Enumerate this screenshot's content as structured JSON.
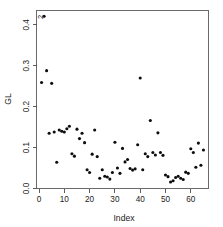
{
  "chart_data": {
    "type": "scatter",
    "title": "",
    "xlabel": "Index",
    "ylabel": "GL",
    "xlim": [
      -1,
      67
    ],
    "ylim": [
      0.0,
      0.435
    ],
    "grid": false,
    "legend": null,
    "xticks": [
      0,
      10,
      20,
      30,
      40,
      50,
      60
    ],
    "xtick_labels": [
      "0",
      "10",
      "20",
      "30",
      "40",
      "50",
      "60"
    ],
    "yticks": [
      0.0,
      0.1,
      0.2,
      0.3,
      0.4
    ],
    "ytick_labels": [
      "0.0",
      "0.1",
      "0.2",
      "0.3",
      "0.4"
    ],
    "marker": "filled-circle",
    "marker_color": "#0d0d0d",
    "annotations": [
      {
        "text": "2",
        "x": 2,
        "y": 0.405,
        "dx": -1,
        "dy": -6
      }
    ],
    "x": [
      1,
      2,
      3,
      4,
      5,
      6,
      7,
      8,
      9,
      10,
      11,
      12,
      13,
      14,
      15,
      16,
      17,
      18,
      19,
      20,
      21,
      22,
      23,
      24,
      25,
      26,
      27,
      28,
      29,
      30,
      31,
      32,
      33,
      34,
      35,
      36,
      37,
      38,
      39,
      40,
      41,
      42,
      43,
      44,
      45,
      46,
      47,
      48,
      49,
      50,
      51,
      52,
      53,
      54,
      55,
      56,
      57,
      58,
      59,
      60,
      61,
      62,
      63,
      64,
      65
    ],
    "y": [
      0.259,
      0.421,
      0.288,
      0.135,
      0.257,
      0.138,
      0.064,
      0.143,
      0.14,
      0.138,
      0.146,
      0.152,
      0.085,
      0.079,
      0.145,
      0.122,
      0.135,
      0.112,
      0.046,
      0.039,
      0.084,
      0.143,
      0.078,
      0.025,
      0.046,
      0.03,
      0.028,
      0.023,
      0.039,
      0.113,
      0.05,
      0.037,
      0.098,
      0.065,
      0.071,
      0.049,
      0.045,
      0.048,
      0.107,
      0.27,
      0.046,
      0.085,
      0.078,
      0.166,
      0.088,
      0.082,
      0.136,
      0.088,
      0.081,
      0.033,
      0.029,
      0.016,
      0.019,
      0.027,
      0.03,
      0.025,
      0.022,
      0.04,
      0.037,
      0.097,
      0.088,
      0.052,
      0.111,
      0.057,
      0.094
    ],
    "series": [
      {
        "name": "GL",
        "values": [
          0.259,
          0.421,
          0.288,
          0.135,
          0.257,
          0.138,
          0.064,
          0.143,
          0.14,
          0.138,
          0.146,
          0.152,
          0.085,
          0.079,
          0.145,
          0.122,
          0.135,
          0.112,
          0.046,
          0.039,
          0.084,
          0.143,
          0.078,
          0.025,
          0.046,
          0.03,
          0.028,
          0.023,
          0.039,
          0.113,
          0.05,
          0.037,
          0.098,
          0.065,
          0.071,
          0.049,
          0.045,
          0.048,
          0.107,
          0.27,
          0.046,
          0.085,
          0.078,
          0.166,
          0.088,
          0.082,
          0.136,
          0.088,
          0.081,
          0.033,
          0.029,
          0.016,
          0.019,
          0.027,
          0.03,
          0.025,
          0.022,
          0.04,
          0.037,
          0.097,
          0.088,
          0.052,
          0.111,
          0.057,
          0.094
        ]
      }
    ]
  }
}
